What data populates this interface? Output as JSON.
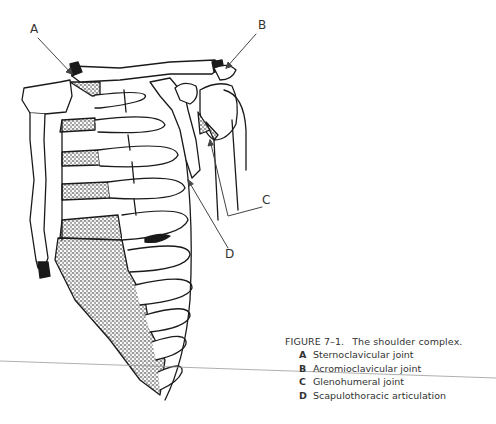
{
  "figure": {
    "number": "FIGURE 7–1.",
    "title": "The shoulder complex.",
    "callouts": [
      {
        "key": "A",
        "x": 30,
        "y": 22
      },
      {
        "key": "B",
        "x": 258,
        "y": 18
      },
      {
        "key": "C",
        "x": 262,
        "y": 193
      },
      {
        "key": "D",
        "x": 225,
        "y": 247
      }
    ],
    "legend": [
      {
        "key": "A",
        "text": "Sternoclavicular joint"
      },
      {
        "key": "B",
        "text": "Acromioclavicular joint"
      },
      {
        "key": "C",
        "text": "Glenohumeral joint"
      },
      {
        "key": "D",
        "text": "Scapulothoracic articulation"
      }
    ]
  },
  "colors": {
    "ink": "#1a1a1a",
    "caption_text": "#333333",
    "scan_line": "#9a9a9a"
  }
}
